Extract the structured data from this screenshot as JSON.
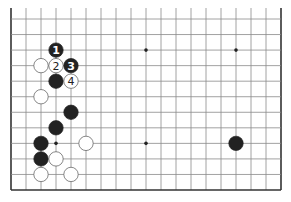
{
  "diagram": {
    "type": "go-board-partial",
    "board_size": 19,
    "visible_columns": 19,
    "visible_rows": 12,
    "edges_shown": [
      "left",
      "right",
      "bottom"
    ],
    "colors": {
      "background": "#ffffff",
      "line": "#8a8a8a",
      "border": "#333333",
      "black_stone": "#222222",
      "white_stone": "#ffffff",
      "white_stone_edge": "#555555"
    },
    "star_points": [
      {
        "col": 3,
        "row": 8
      },
      {
        "col": 9,
        "row": 2
      },
      {
        "col": 15,
        "row": 2
      },
      {
        "col": 9,
        "row": 8
      },
      {
        "col": 15,
        "row": 8
      }
    ],
    "stones": [
      {
        "col": 3,
        "row": 2,
        "color": "black",
        "label": "1"
      },
      {
        "col": 2,
        "row": 3,
        "color": "white",
        "label": ""
      },
      {
        "col": 3,
        "row": 3,
        "color": "white",
        "label": "2"
      },
      {
        "col": 4,
        "row": 3,
        "color": "black",
        "label": "3"
      },
      {
        "col": 3,
        "row": 4,
        "color": "black",
        "label": ""
      },
      {
        "col": 4,
        "row": 4,
        "color": "white",
        "label": "4"
      },
      {
        "col": 2,
        "row": 5,
        "color": "white",
        "label": ""
      },
      {
        "col": 4,
        "row": 6,
        "color": "black",
        "label": ""
      },
      {
        "col": 3,
        "row": 7,
        "color": "black",
        "label": ""
      },
      {
        "col": 2,
        "row": 8,
        "color": "black",
        "label": ""
      },
      {
        "col": 5,
        "row": 8,
        "color": "white",
        "label": ""
      },
      {
        "col": 2,
        "row": 9,
        "color": "black",
        "label": ""
      },
      {
        "col": 3,
        "row": 9,
        "color": "white",
        "label": ""
      },
      {
        "col": 2,
        "row": 10,
        "color": "white",
        "label": ""
      },
      {
        "col": 4,
        "row": 10,
        "color": "white",
        "label": ""
      },
      {
        "col": 15,
        "row": 8,
        "color": "black",
        "label": ""
      }
    ]
  }
}
